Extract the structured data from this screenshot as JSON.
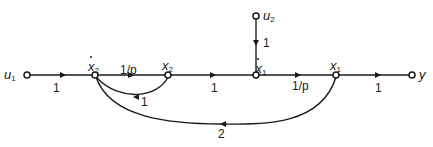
{
  "diagram": {
    "type": "signal-flow-graph",
    "nodes": [
      {
        "id": "u1",
        "label": "u",
        "sub": "1",
        "dot": false
      },
      {
        "id": "x2dot",
        "label": "x",
        "sub": "2",
        "dot": true
      },
      {
        "id": "x2",
        "label": "x",
        "sub": "2",
        "dot": false
      },
      {
        "id": "x1dot",
        "label": "x",
        "sub": "1",
        "dot": true
      },
      {
        "id": "x1",
        "label": "x",
        "sub": "1",
        "dot": false
      },
      {
        "id": "y",
        "label": "y",
        "sub": "",
        "dot": false
      },
      {
        "id": "u2",
        "label": "u",
        "sub": "2",
        "dot": false
      }
    ],
    "edges": [
      {
        "from": "u1",
        "to": "x2dot",
        "gain": "1"
      },
      {
        "from": "x2dot",
        "to": "x2",
        "gain": "1/p"
      },
      {
        "from": "x2",
        "to": "x2dot",
        "gain": "1"
      },
      {
        "from": "x2",
        "to": "x1dot",
        "gain": "1"
      },
      {
        "from": "u2",
        "to": "x1dot",
        "gain": "1"
      },
      {
        "from": "x1dot",
        "to": "x1",
        "gain": "1/p"
      },
      {
        "from": "x1",
        "to": "y",
        "gain": "1"
      },
      {
        "from": "x1",
        "to": "x2dot",
        "gain": "2"
      }
    ]
  }
}
